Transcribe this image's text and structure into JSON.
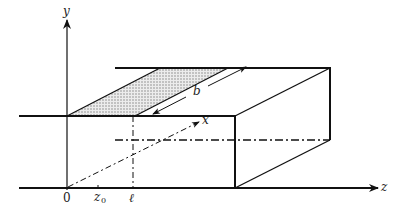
{
  "figure": {
    "type": "waveguide-geometry",
    "colors": {
      "line": "#111111",
      "shade": "#bdbdbd",
      "background": "#ffffff"
    }
  },
  "axes": {
    "y": {
      "label": "y"
    },
    "z": {
      "label": "z"
    },
    "x": {
      "label": "x"
    }
  },
  "ticks": {
    "origin": "0",
    "z0_main": "z",
    "z0_sub": "0",
    "ell": "ℓ"
  },
  "dimensions": {
    "b": {
      "label": "b"
    }
  }
}
